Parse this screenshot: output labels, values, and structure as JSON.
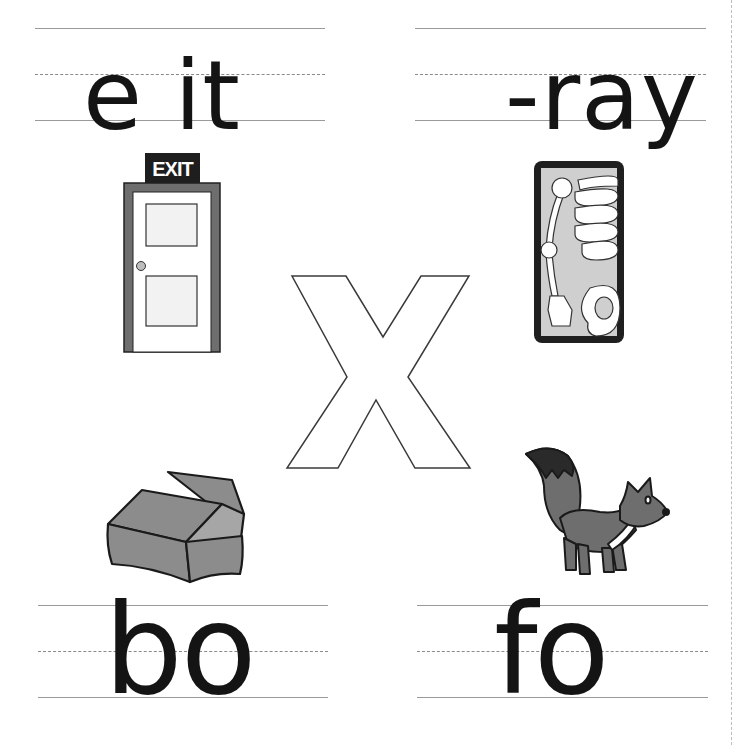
{
  "worksheet": {
    "center_letter": "X",
    "colors": {
      "ink": "#141414",
      "guide_line": "#9a9a9a",
      "illustration_gray": "#7a7a7a",
      "xray_bg": "#cfcfcf"
    },
    "cells": [
      {
        "id": "exit",
        "word_template": "e it",
        "missing_letter_position": 2,
        "picture": "exit-door"
      },
      {
        "id": "xray",
        "word_template": "-ray",
        "missing_letter_position": 1,
        "picture": "x-ray"
      },
      {
        "id": "box",
        "word_template": "bo",
        "missing_letter_position": 3,
        "picture": "cardboard-box"
      },
      {
        "id": "fox",
        "word_template": "fo",
        "missing_letter_position": 3,
        "picture": "fox"
      }
    ],
    "exit_sign_text": "EXIT"
  }
}
